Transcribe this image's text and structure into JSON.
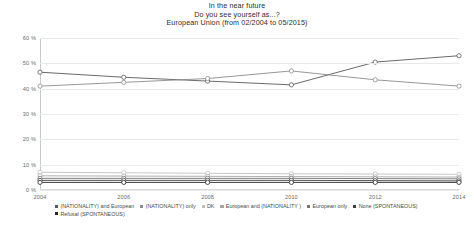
{
  "title": {
    "line1": "In the near future",
    "line2": "Do you see yourself as...?",
    "line3": "European Union (from 02/2004 to 05/2015)"
  },
  "legend": {
    "row1": [
      {
        "label": "(NATIONALITY) and European",
        "color": "#595959"
      },
      {
        "label": "(NATIONALITY) only",
        "color": "#8c8c8c"
      },
      {
        "label": "DK",
        "color": "#bfbfbf"
      },
      {
        "label": "European and (NATIONALITY )",
        "color": "#a6a6a6"
      },
      {
        "label": "European only",
        "color": "#737373"
      },
      {
        "label": "None (SPONTANEOUS)",
        "color": "#404040"
      }
    ],
    "row2": [
      {
        "label": "Refusal (SPONTANEOUS)",
        "color": "#262626"
      }
    ]
  },
  "chart_data": {
    "type": "line",
    "xlabel": "",
    "ylabel": "",
    "x": [
      2004,
      2006,
      2008,
      2010,
      2012,
      2014
    ],
    "categories": [
      "2004",
      "2006",
      "2008",
      "2010",
      "2012",
      "2014"
    ],
    "xticklabels": [
      "2004",
      "2006",
      "2008",
      "2010",
      "2012",
      "2014"
    ],
    "yticklabels": [
      "0 %",
      "10 %",
      "20 %",
      "30 %",
      "40 %",
      "50 %",
      "60 %"
    ],
    "yticks": [
      0,
      10,
      20,
      30,
      40,
      50,
      60
    ],
    "ylim": [
      0,
      60
    ],
    "xlim": [
      2004,
      2014
    ],
    "grid": true,
    "legend_position": "bottom",
    "marker": "circle-open",
    "series": [
      {
        "name": "(NATIONALITY) and European",
        "color": "#595959",
        "values": [
          46.5,
          44.5,
          43.0,
          41.5,
          50.5,
          53.0
        ]
      },
      {
        "name": "(NATIONALITY) only",
        "color": "#8c8c8c",
        "values": [
          41.0,
          42.5,
          44.0,
          47.0,
          43.5,
          41.0
        ]
      },
      {
        "name": "DK",
        "color": "#bfbfbf",
        "values": [
          7.0,
          6.8,
          6.6,
          6.4,
          6.3,
          6.2
        ]
      },
      {
        "name": "European and (NATIONALITY )",
        "color": "#a6a6a6",
        "values": [
          5.6,
          5.5,
          5.4,
          5.3,
          5.2,
          5.1
        ]
      },
      {
        "name": "European only",
        "color": "#737373",
        "values": [
          4.6,
          4.6,
          4.6,
          4.6,
          4.5,
          4.4
        ]
      },
      {
        "name": "None (SPONTANEOUS)",
        "color": "#404040",
        "values": [
          3.8,
          3.8,
          3.8,
          3.8,
          3.7,
          3.6
        ]
      },
      {
        "name": "Refusal (SPONTANEOUS)",
        "color": "#262626",
        "values": [
          3.0,
          3.0,
          3.0,
          3.0,
          3.0,
          3.0
        ]
      }
    ]
  }
}
